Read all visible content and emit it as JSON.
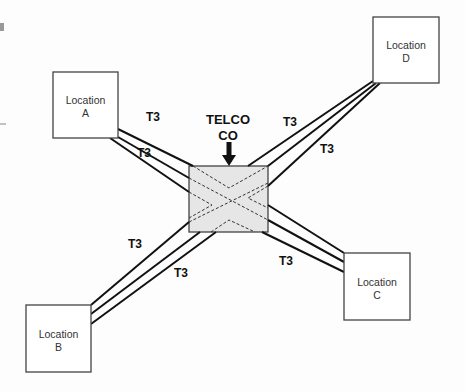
{
  "diagram": {
    "type": "network-topology",
    "hub": {
      "label_line1": "TELCO",
      "label_line2": "CO",
      "fill": "#e6e6e6"
    },
    "locations": [
      {
        "id": "A",
        "line1": "Location",
        "line2": "A"
      },
      {
        "id": "B",
        "line1": "Location",
        "line2": "B"
      },
      {
        "id": "C",
        "line1": "Location",
        "line2": "C"
      },
      {
        "id": "D",
        "line1": "Location",
        "line2": "D"
      }
    ],
    "links": [
      {
        "from": "A",
        "to": "TELCO CO",
        "labels": [
          "T3",
          "T3"
        ]
      },
      {
        "from": "B",
        "to": "TELCO CO",
        "labels": [
          "T3",
          "T3"
        ]
      },
      {
        "from": "C",
        "to": "TELCO CO",
        "labels": [
          "T3"
        ]
      },
      {
        "from": "D",
        "to": "TELCO CO",
        "labels": [
          "T3",
          "T3"
        ]
      }
    ],
    "link_label": "T3"
  }
}
